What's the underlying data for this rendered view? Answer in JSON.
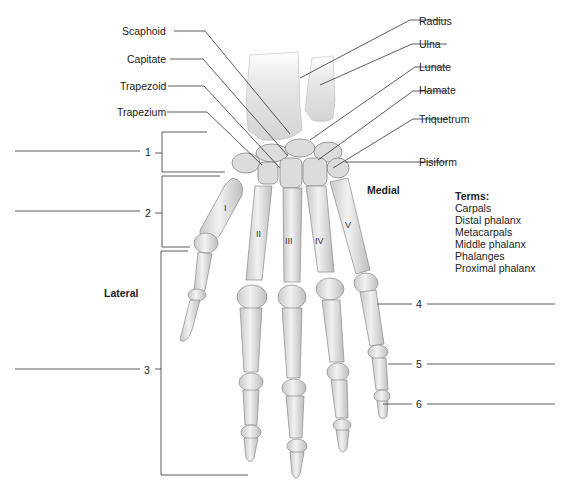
{
  "diagram": {
    "left_labels": [
      "Scaphoid",
      "Capitate",
      "Trapezoid",
      "Trapezium"
    ],
    "right_labels": [
      "Radius",
      "Ulna",
      "Lunate",
      "Hamate",
      "Triquetrum",
      "Pisiform"
    ],
    "orientation": {
      "lateral": "Lateral",
      "medial": "Medial"
    },
    "numbered_blanks": [
      {
        "number": "1",
        "side": "left",
        "region": "carpals"
      },
      {
        "number": "2",
        "side": "left",
        "region": "metacarpals"
      },
      {
        "number": "3",
        "side": "left",
        "region": "phalanges"
      },
      {
        "number": "4",
        "side": "right",
        "region": "proximal phalanx"
      },
      {
        "number": "5",
        "side": "right",
        "region": "middle phalanx"
      },
      {
        "number": "6",
        "side": "right",
        "region": "distal phalanx"
      }
    ],
    "metacarpal_numerals": [
      "I",
      "II",
      "III",
      "IV",
      "V"
    ],
    "terms": {
      "title": "Terms:",
      "items": [
        "Carpals",
        "Distal phalanx",
        "Metacarpals",
        "Middle phalanx",
        "Phalanges",
        "Proximal phalanx"
      ]
    }
  }
}
